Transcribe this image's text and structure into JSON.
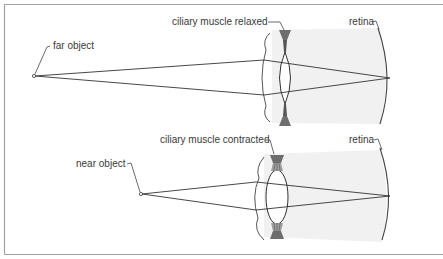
{
  "diagram": {
    "colors": {
      "frame": "#9a9a9a",
      "line": "#333333",
      "shade": "#f0f0f0",
      "muscle": "#6e6e6e",
      "muscle_light": "#9e9e9e"
    },
    "panels": [
      {
        "id": "far",
        "object_label": "far object",
        "muscle_label": "ciliary muscle relaxed",
        "retina_label": "retina",
        "muscle_state": "relaxed"
      },
      {
        "id": "near",
        "object_label": "near object",
        "muscle_label": "ciliary muscle contracted",
        "retina_label": "retina",
        "muscle_state": "contracted"
      }
    ]
  }
}
